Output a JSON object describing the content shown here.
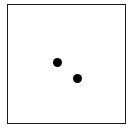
{
  "figure": {
    "frame_color": "#1a1a1a",
    "dot_color": "#000000",
    "dots": [
      {
        "cx": 57,
        "cy": 62
      },
      {
        "cx": 77,
        "cy": 78
      }
    ]
  }
}
